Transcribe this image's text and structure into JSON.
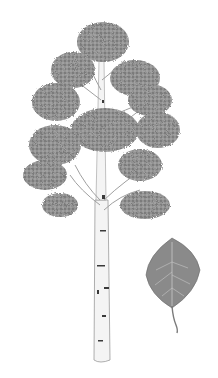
{
  "image": {
    "subject": "Botanical illustration of a quaking aspen tree with a single leaf",
    "colors": {
      "background": "#ffffff",
      "foliage": "#8f8f8f",
      "foliage_dark": "#6e6e6e",
      "foliage_light": "#b5b5b5",
      "bark": "#f4f4f4",
      "bark_outline": "#9a9a9a",
      "bark_marks": "#3a3a3a",
      "leaf": "#8a8a8a",
      "leaf_vein": "#c8c8c8"
    }
  }
}
